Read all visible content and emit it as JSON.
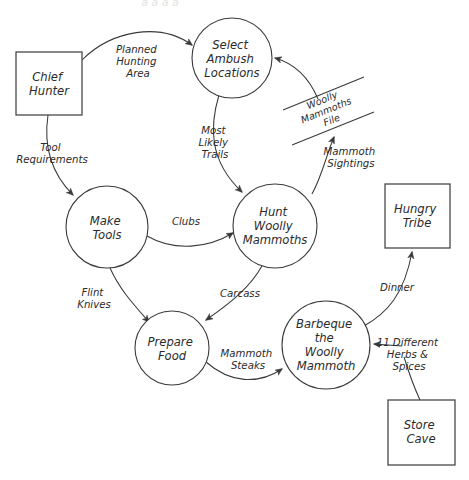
{
  "diagram": {
    "type": "data-flow-diagram",
    "width": 469,
    "height": 480,
    "background_color": "#ffffff",
    "line_color": "#3a3a3a",
    "text_color": "#2b2b2b",
    "top_clipped_text": "a a a a"
  },
  "processes": [
    {
      "id": "select-ambush-locations",
      "lines": [
        "Select",
        "Ambush",
        "Locations"
      ],
      "cx": 232,
      "cy": 58,
      "r": 40
    },
    {
      "id": "make-tools",
      "lines": [
        "Make",
        "Tools"
      ],
      "cx": 107,
      "cy": 227,
      "r": 41
    },
    {
      "id": "hunt-woolly-mammoths",
      "lines": [
        "Hunt",
        "Woolly",
        "Mammoths"
      ],
      "cx": 275,
      "cy": 226,
      "r": 42
    },
    {
      "id": "prepare-food",
      "lines": [
        "Prepare",
        "Food"
      ],
      "cx": 172,
      "cy": 348,
      "r": 37
    },
    {
      "id": "barbeque-the-woolly-mammoth",
      "lines": [
        "Barbeque",
        "the",
        "Woolly",
        "Mammoth"
      ],
      "cx": 326,
      "cy": 345,
      "r": 44
    }
  ],
  "entities": [
    {
      "id": "chief-hunter",
      "lines": [
        "Chief",
        "Hunter"
      ],
      "x": 16,
      "y": 52,
      "w": 66,
      "h": 63
    },
    {
      "id": "hungry-tribe",
      "lines": [
        "Hungry",
        "Tribe"
      ],
      "x": 385,
      "y": 184,
      "w": 65,
      "h": 64
    },
    {
      "id": "store-cave",
      "lines": [
        "Store",
        "Cave"
      ],
      "x": 388,
      "y": 400,
      "w": 67,
      "h": 65
    }
  ],
  "data_stores": [
    {
      "id": "woolly-mammoths-file",
      "lines": [
        "Woolly",
        "Mammoths",
        "File"
      ]
    }
  ],
  "flows": [
    {
      "id": "planned-hunting-area",
      "lines": [
        "Planned",
        "Hunting",
        "Area"
      ],
      "from": "chief-hunter",
      "to": "select-ambush-locations"
    },
    {
      "id": "tool-requirements",
      "lines": [
        "Tool",
        "Requirements"
      ],
      "from": "chief-hunter",
      "to": "make-tools"
    },
    {
      "id": "most-likely-trails",
      "lines": [
        "Most",
        "Likely",
        "Trails"
      ],
      "from": "select-ambush-locations",
      "to": "hunt-woolly-mammoths"
    },
    {
      "id": "mammoth-sightings",
      "lines": [
        "Mammoth",
        "Sightings"
      ],
      "from": "hunt-woolly-mammoths",
      "to": "woolly-mammoths-file"
    },
    {
      "id": "woolly-mammoths-file-to-select",
      "lines": [],
      "from": "woolly-mammoths-file",
      "to": "select-ambush-locations"
    },
    {
      "id": "clubs",
      "lines": [
        "Clubs"
      ],
      "from": "make-tools",
      "to": "hunt-woolly-mammoths"
    },
    {
      "id": "flint-knives",
      "lines": [
        "Flint",
        "Knives"
      ],
      "from": "make-tools",
      "to": "prepare-food"
    },
    {
      "id": "carcass",
      "lines": [
        "Carcass"
      ],
      "from": "hunt-woolly-mammoths",
      "to": "prepare-food"
    },
    {
      "id": "mammoth-steaks",
      "lines": [
        "Mammoth",
        "Steaks"
      ],
      "from": "prepare-food",
      "to": "barbeque-the-woolly-mammoth"
    },
    {
      "id": "dinner",
      "lines": [
        "Dinner"
      ],
      "from": "barbeque-the-woolly-mammoth",
      "to": "hungry-tribe"
    },
    {
      "id": "herbs-and-spices",
      "lines": [
        "11 Different",
        "Herbs &",
        "Spices"
      ],
      "from": "store-cave",
      "to": "barbeque-the-woolly-mammoth"
    }
  ]
}
